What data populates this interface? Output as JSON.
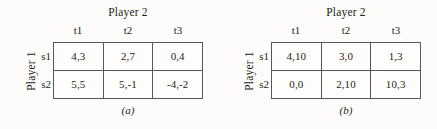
{
  "figure": {
    "panels": [
      {
        "id": "panel-a",
        "caption": "(a)",
        "column_player_label": "Player 2",
        "row_player_label": "Player 1",
        "column_headers": [
          "t1",
          "t2",
          "t3"
        ],
        "row_headers": [
          "s1",
          "s2"
        ],
        "cells": [
          [
            "4,3",
            "2,7",
            "0,4"
          ],
          [
            "5,5",
            "5,-1",
            "-4,-2"
          ]
        ]
      },
      {
        "id": "panel-b",
        "caption": "(b)",
        "column_player_label": "Player 2",
        "row_player_label": "Player 1",
        "column_headers": [
          "t1",
          "t2",
          "t3"
        ],
        "row_headers": [
          "s1",
          "s2"
        ],
        "cells": [
          [
            "4,10",
            "3,0",
            "1,3"
          ],
          [
            "0,0",
            "2,10",
            "10,3"
          ]
        ]
      }
    ]
  },
  "chart_data": {
    "type": "table",
    "title": "",
    "tables": [
      {
        "label": "(a)",
        "row_player": "Player 1",
        "column_player": "Player 2",
        "row_strategies": [
          "s1",
          "s2"
        ],
        "column_strategies": [
          "t1",
          "t2",
          "t3"
        ],
        "payoffs": [
          [
            [
              4,
              3
            ],
            [
              2,
              7
            ],
            [
              0,
              4
            ]
          ],
          [
            [
              5,
              5
            ],
            [
              5,
              -1
            ],
            [
              -4,
              -2
            ]
          ]
        ],
        "payoff_text": [
          [
            "4,3",
            "2,7",
            "0,4"
          ],
          [
            "5,5",
            "5,-1",
            "-4,-2"
          ]
        ]
      },
      {
        "label": "(b)",
        "row_player": "Player 1",
        "column_player": "Player 2",
        "row_strategies": [
          "s1",
          "s2"
        ],
        "column_strategies": [
          "t1",
          "t2",
          "t3"
        ],
        "payoffs": [
          [
            [
              4,
              10
            ],
            [
              3,
              0
            ],
            [
              1,
              3
            ]
          ],
          [
            [
              0,
              0
            ],
            [
              2,
              10
            ],
            [
              10,
              3
            ]
          ]
        ],
        "payoff_text": [
          [
            "4,10",
            "3,0",
            "1,3"
          ],
          [
            "0,0",
            "2,10",
            "10,3"
          ]
        ]
      }
    ]
  },
  "colors": {
    "background": "#fdfcfa",
    "text": "#231f20",
    "grid_line": "#58565a"
  }
}
